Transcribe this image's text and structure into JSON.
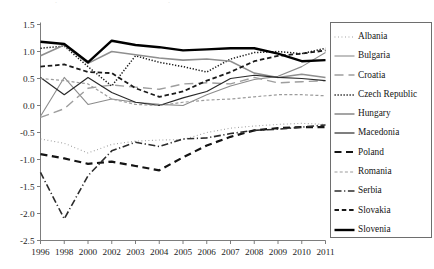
{
  "chart_data": {
    "type": "line",
    "title": "",
    "subtitle": "",
    "xlabel": "",
    "ylabel": "",
    "categories": [
      "1996",
      "1998",
      "2000",
      "2002",
      "2003",
      "2004",
      "2005",
      "2006",
      "2007",
      "2008",
      "2009",
      "2010",
      "2011"
    ],
    "ylim": [
      -2.5,
      1.5
    ],
    "yticks": [
      "1.5",
      "1.0",
      "0.5",
      "0.0",
      "-0.5",
      "-1.0",
      "-1.5",
      "-2.0",
      "-2.5"
    ],
    "ytick_values": [
      1.5,
      1.0,
      0.5,
      0.0,
      -0.5,
      -1.0,
      -1.5,
      -2.0,
      -2.5
    ],
    "grid": false,
    "legend_position": "right",
    "series": [
      {
        "name": "Albania",
        "style": "dotted",
        "color": "#9a9a9a",
        "width": 1.1,
        "values": [
          -0.62,
          -0.7,
          -0.88,
          -0.72,
          -0.66,
          -0.64,
          -0.63,
          -0.5,
          -0.42,
          -0.38,
          -0.35,
          -0.33,
          -0.35
        ]
      },
      {
        "name": "Bulgaria",
        "style": "solid",
        "color": "#8c8c8c",
        "width": 1.1,
        "values": [
          -0.2,
          0.52,
          0.02,
          0.12,
          0.06,
          0.02,
          0.0,
          0.2,
          0.36,
          0.48,
          0.54,
          0.72,
          0.98
        ]
      },
      {
        "name": "Croatia",
        "style": "longdash",
        "color": "#9e9e9e",
        "width": 1.4,
        "values": [
          -0.22,
          -0.06,
          0.32,
          0.38,
          0.34,
          0.3,
          0.4,
          0.42,
          0.4,
          0.52,
          0.42,
          0.44,
          0.46
        ]
      },
      {
        "name": "Czech Republic",
        "style": "dotted-dense",
        "color": "#1a1a1a",
        "width": 1.5,
        "values": [
          1.06,
          1.1,
          0.72,
          0.36,
          0.92,
          0.8,
          0.72,
          0.62,
          0.86,
          0.98,
          1.0,
          0.96,
          1.06
        ]
      },
      {
        "name": "Hungary",
        "style": "solid",
        "color": "#8f8f8f",
        "width": 1.6,
        "values": [
          0.92,
          1.12,
          0.78,
          1.0,
          0.94,
          0.88,
          0.84,
          0.86,
          0.82,
          0.6,
          0.52,
          0.58,
          0.52
        ]
      },
      {
        "name": "Macedonia",
        "style": "solid",
        "color": "#2a2a2a",
        "width": 1.2,
        "values": [
          0.52,
          0.2,
          0.52,
          0.24,
          0.06,
          0.0,
          0.14,
          0.26,
          0.5,
          0.56,
          0.52,
          0.5,
          0.46
        ]
      },
      {
        "name": "Poland",
        "style": "dash",
        "color": "#141414",
        "width": 2.2,
        "values": [
          -0.9,
          -0.98,
          -1.08,
          -1.04,
          -1.12,
          -1.2,
          -0.96,
          -0.74,
          -0.58,
          -0.46,
          -0.42,
          -0.4,
          -0.4
        ]
      },
      {
        "name": "Romania",
        "style": "shortdash",
        "color": "#9c9c9c",
        "width": 1.2,
        "values": [
          0.5,
          0.46,
          0.4,
          0.12,
          0.02,
          0.0,
          0.06,
          0.1,
          0.12,
          0.16,
          0.2,
          0.2,
          0.18
        ]
      },
      {
        "name": "Serbia",
        "style": "dashdot",
        "color": "#2c2c2c",
        "width": 1.6,
        "values": [
          -1.24,
          -2.1,
          -1.3,
          -0.84,
          -0.68,
          -0.76,
          -0.62,
          -0.6,
          -0.52,
          -0.46,
          -0.44,
          -0.4,
          -0.36
        ]
      },
      {
        "name": "Slovakia",
        "style": "dash-med",
        "color": "#1a1a1a",
        "width": 1.8,
        "values": [
          0.72,
          0.76,
          0.62,
          0.6,
          0.32,
          0.16,
          0.26,
          0.46,
          0.62,
          0.82,
          0.92,
          0.96,
          1.02
        ]
      },
      {
        "name": "Slovenia",
        "style": "solid",
        "color": "#000000",
        "width": 2.4,
        "values": [
          1.18,
          1.14,
          0.8,
          1.2,
          1.12,
          1.08,
          1.02,
          1.04,
          1.06,
          1.06,
          0.96,
          0.82,
          0.84
        ]
      }
    ]
  },
  "legend": {
    "items": [
      {
        "label": "Albania"
      },
      {
        "label": "Bulgaria"
      },
      {
        "label": "Croatia"
      },
      {
        "label": "Czech Republic"
      },
      {
        "label": "Hungary"
      },
      {
        "label": "Macedonia"
      },
      {
        "label": "Poland"
      },
      {
        "label": "Romania"
      },
      {
        "label": "Serbia"
      },
      {
        "label": "Slovakia"
      },
      {
        "label": "Slovenia"
      }
    ]
  },
  "axes": {
    "axis_color": "#6e6e6e"
  }
}
